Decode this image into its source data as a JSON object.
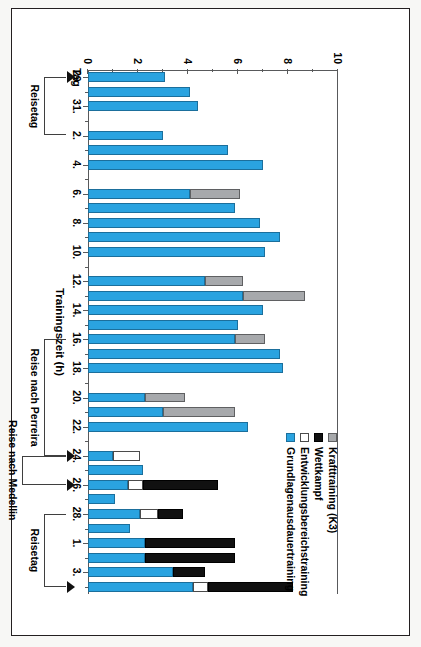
{
  "chart_data": {
    "type": "bar",
    "orientation": "horizontal-rotated",
    "title": "",
    "xlabel": "Tag",
    "ylabel": "Trainingszeit (h)",
    "ylim": [
      0,
      10
    ],
    "yticks": [
      "0",
      "2",
      "4",
      "6",
      "8",
      "10"
    ],
    "ytick_values": [
      0,
      2,
      4,
      6,
      8,
      10
    ],
    "minor_tick_step": 1,
    "grid": false,
    "stacked": true,
    "legend_position": "bottom-right",
    "series": [
      {
        "name": "Krafttraining (K3)",
        "color": "#a7a9ac"
      },
      {
        "name": "Wettkampf",
        "color": "#111111"
      },
      {
        "name": "Entwicklungsbereichstraining",
        "color": "#ffffff"
      },
      {
        "name": "Grundlagenausdauertraining",
        "color": "#2aa3e0"
      }
    ],
    "categories": [
      "29.",
      "30.",
      "31.",
      "1.",
      "2.",
      "3.",
      "4.",
      "5.",
      "6.",
      "7.",
      "8.",
      "9.",
      "10.",
      "11.",
      "12.",
      "13.",
      "14.",
      "15.",
      "16.",
      "17.",
      "18.",
      "19.",
      "20.",
      "21.",
      "22.",
      "23.",
      "24.",
      "25.",
      "26.",
      "27.",
      "28.",
      "29.",
      "1.",
      "2.",
      "3.",
      "4."
    ],
    "tick_labels": [
      {
        "category": "29.",
        "label": "29."
      },
      {
        "category": "31.",
        "label": "31."
      },
      {
        "category": "2.",
        "label": "2."
      },
      {
        "category": "4.",
        "label": "4."
      },
      {
        "category": "6.",
        "label": "6."
      },
      {
        "category": "8.",
        "label": "8."
      },
      {
        "category": "10.",
        "label": "10."
      },
      {
        "category": "12.",
        "label": "12."
      },
      {
        "category": "14.",
        "label": "14."
      },
      {
        "category": "16.",
        "label": "16."
      },
      {
        "category": "18.",
        "label": "18."
      },
      {
        "category": "20.",
        "label": "20."
      },
      {
        "category": "22.",
        "label": "22."
      },
      {
        "category": "24.",
        "label": "24."
      },
      {
        "category": "26.",
        "label": "26."
      },
      {
        "category": "28.",
        "label": "28."
      },
      {
        "category": "2.",
        "label": "2."
      },
      {
        "category": "4.",
        "label": "4."
      }
    ],
    "values": {
      "Grundlagenausdauertraining": [
        3.1,
        4.1,
        4.4,
        0.0,
        3.0,
        5.6,
        7.0,
        0.0,
        4.1,
        5.9,
        6.9,
        7.7,
        7.1,
        0.0,
        4.7,
        6.2,
        7.0,
        6.0,
        5.9,
        7.7,
        7.8,
        0.0,
        2.3,
        3.0,
        6.4,
        0.0,
        1.0,
        2.2,
        1.6,
        1.1,
        2.1,
        1.7,
        2.3,
        2.3,
        3.4,
        4.2
      ],
      "Entwicklungsbereichstraining": [
        0.0,
        0.0,
        0.0,
        0.0,
        0.0,
        0.0,
        0.0,
        0.0,
        0.0,
        0.0,
        0.0,
        0.0,
        0.0,
        0.0,
        0.0,
        0.0,
        0.0,
        0.0,
        0.0,
        0.0,
        0.0,
        0.0,
        0.0,
        0.0,
        0.0,
        0.0,
        1.1,
        0.0,
        0.6,
        0.0,
        0.7,
        0.0,
        0.0,
        0.0,
        0.0,
        0.6
      ],
      "Wettkampf": [
        0.0,
        0.0,
        0.0,
        0.0,
        0.0,
        0.0,
        0.0,
        0.0,
        0.0,
        0.0,
        0.0,
        0.0,
        0.0,
        0.0,
        0.0,
        0.0,
        0.0,
        0.0,
        0.0,
        0.0,
        0.0,
        0.0,
        0.0,
        0.0,
        0.0,
        0.0,
        0.0,
        0.0,
        3.0,
        0.0,
        1.0,
        0.0,
        3.6,
        3.6,
        1.3,
        3.4
      ],
      "Krafttraining (K3)": [
        0.0,
        0.0,
        0.0,
        0.0,
        0.0,
        0.0,
        0.0,
        0.0,
        2.0,
        0.0,
        0.0,
        0.0,
        0.0,
        0.0,
        1.5,
        2.5,
        0.0,
        0.0,
        1.2,
        0.0,
        0.0,
        0.0,
        1.6,
        2.9,
        0.0,
        0.0,
        0.0,
        0.0,
        0.0,
        0.0,
        0.0,
        0.0,
        0.0,
        0.0,
        0.0,
        0.0
      ]
    },
    "annotations": [
      {
        "label": "Reisetag",
        "span_from": "29.",
        "span_to": "2.",
        "marker": "arrow"
      },
      {
        "label": "Reise nach Perreira",
        "span_from": "16.",
        "span_to": "24.",
        "marker": "arrow"
      },
      {
        "label": "Reise nach Medellin",
        "span_from": "24.",
        "span_to": "26.",
        "marker": "arrow"
      },
      {
        "label": "Reisetag",
        "span_from": "28.",
        "span_to": "4.",
        "marker": "arrow"
      }
    ]
  },
  "axes": {
    "value_axis_title": "Trainingszeit (h)",
    "category_axis_title": "Tag"
  },
  "legend": {
    "items": [
      {
        "label": "Krafttraining (K3)",
        "swatch": "kt"
      },
      {
        "label": "Wettkampf",
        "swatch": "wk"
      },
      {
        "label": "Entwicklungsbereichstraining",
        "swatch": "ebt"
      },
      {
        "label": "Grundlagenausdauertraining",
        "swatch": "gla"
      }
    ]
  }
}
